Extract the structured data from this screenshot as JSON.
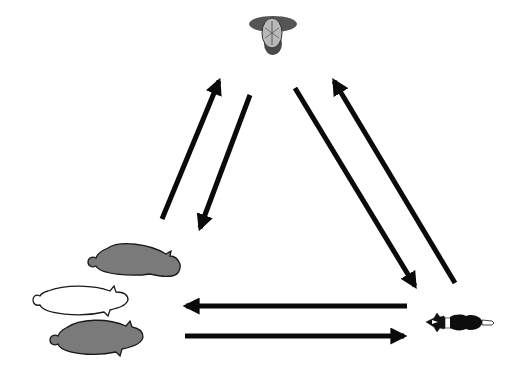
{
  "diagram": {
    "type": "cycle",
    "colors": {
      "background": "#ffffff",
      "arrow": "#0a0a0a",
      "sheep_gray": "#7a7a7a",
      "sheep_white": "#ffffff",
      "outline": "#1a1a1a",
      "farmer_hat": "#555555",
      "farmer_head": "#b8b8b8",
      "dog_body": "#0d0d0d"
    },
    "nodes": [
      {
        "id": "farmer",
        "icon": "farmer-topdown-icon",
        "position": "top"
      },
      {
        "id": "sheep",
        "icon": "sheep-flock-icon",
        "position": "bottom-left",
        "count": 3
      },
      {
        "id": "dog",
        "icon": "sheepdog-topdown-icon",
        "position": "bottom-right"
      }
    ],
    "edges": [
      {
        "from": "sheep",
        "to": "farmer"
      },
      {
        "from": "farmer",
        "to": "sheep"
      },
      {
        "from": "farmer",
        "to": "dog"
      },
      {
        "from": "dog",
        "to": "farmer"
      },
      {
        "from": "dog",
        "to": "sheep"
      },
      {
        "from": "sheep",
        "to": "dog"
      }
    ]
  }
}
